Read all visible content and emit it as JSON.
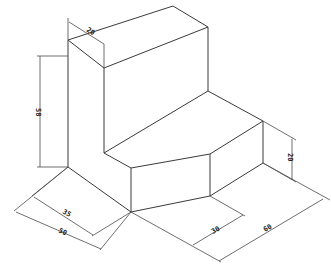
{
  "drawing": {
    "type": "isometric-technical-drawing",
    "description": "L-shaped block with chamfered front step",
    "dimensions": [
      {
        "id": "top-depth",
        "label": "20"
      },
      {
        "id": "upper-height",
        "label": "58"
      },
      {
        "id": "base-width-inner",
        "label": "35"
      },
      {
        "id": "base-width-outer",
        "label": "50"
      },
      {
        "id": "chamfer-length",
        "label": "30"
      },
      {
        "id": "overall-length",
        "label": "60"
      },
      {
        "id": "step-height",
        "label": "20"
      }
    ],
    "colors": {
      "line": "#3a3a3a",
      "background": "#ffffff"
    }
  }
}
